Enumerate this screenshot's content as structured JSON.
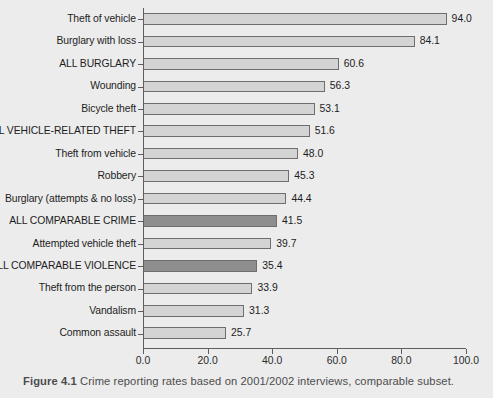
{
  "caption": {
    "figure_number": "Figure 4.1",
    "text": "Crime reporting rates based on 2001/2002 interviews, comparable subset."
  },
  "chart_data": {
    "type": "bar",
    "orientation": "horizontal",
    "title": "",
    "xlabel": "",
    "ylabel": "",
    "xlim": [
      0.0,
      100.0
    ],
    "xticks": [
      "0.0",
      "20.0",
      "40.0",
      "60.0",
      "80.0",
      "100.0"
    ],
    "xtick_values": [
      0,
      20,
      40,
      60,
      80,
      100
    ],
    "grid": false,
    "legend": "none",
    "colors": {
      "bar_light": "#d4d4d4",
      "bar_dark": "#8e8e8e",
      "bar_outline": "#6e6e6e",
      "background": "#ececec",
      "axis": "#5e5e5e",
      "text": "#1d1d1d",
      "caption_text": "#4c4c4c"
    },
    "categories": [
      "Theft of vehicle",
      "Burglary with loss",
      "ALL BURGLARY",
      "Wounding",
      "Bicycle theft",
      "ALL VEHICLE-RELATED THEFT",
      "Theft from vehicle",
      "Robbery",
      "Burglary (attempts & no loss)",
      "ALL COMPARABLE CRIME",
      "Attempted vehicle theft",
      "ALL COMPARABLE VIOLENCE",
      "Theft from the person",
      "Vandalism",
      "Common assault"
    ],
    "values": [
      94.0,
      84.1,
      60.6,
      56.3,
      53.1,
      51.6,
      48.0,
      45.3,
      44.4,
      41.5,
      39.7,
      35.4,
      33.9,
      31.3,
      25.7
    ],
    "value_labels": [
      "94.0",
      "84.1",
      "60.6",
      "56.3",
      "53.1",
      "51.6",
      "48.0",
      "45.3",
      "44.4",
      "41.5",
      "39.7",
      "35.4",
      "33.9",
      "31.3",
      "25.7"
    ],
    "highlighted": [
      false,
      false,
      false,
      false,
      false,
      false,
      false,
      false,
      false,
      true,
      false,
      true,
      false,
      false,
      false
    ]
  }
}
